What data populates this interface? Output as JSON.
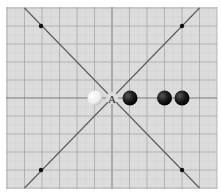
{
  "board": {
    "background": "#dcdcdc",
    "grid_color": "#a8a8a8",
    "axis_color": "#7a7a7a",
    "diagonal_color": "#5a5a5a",
    "x_lines": [
      7,
      24.5,
      42,
      59.5,
      77,
      94.5,
      112,
      129.5,
      147,
      164.5,
      182,
      199.5,
      217
    ],
    "y_lines": [
      8,
      26,
      44,
      62,
      80,
      98,
      116,
      134,
      152,
      170,
      188
    ],
    "bounds": {
      "x": 6,
      "y": 7,
      "w": 211,
      "h": 182
    },
    "center": {
      "x": 112,
      "y": 98
    },
    "diagonals": [
      {
        "x1": 24.5,
        "y1": 8,
        "x2": 199.5,
        "y2": 188
      },
      {
        "x1": 199.5,
        "y1": 8,
        "x2": 24.5,
        "y2": 188
      }
    ],
    "marker_dots": [
      {
        "x": 41,
        "y": 26
      },
      {
        "x": 182,
        "y": 26
      },
      {
        "x": 41,
        "y": 170
      },
      {
        "x": 182,
        "y": 170
      }
    ]
  },
  "point_label": {
    "text": "A",
    "x": 112,
    "y": 98
  },
  "stones": [
    {
      "color": "white",
      "x": 95,
      "y": 98
    },
    {
      "color": "black",
      "x": 130,
      "y": 98
    },
    {
      "color": "black",
      "x": 164.5,
      "y": 98
    },
    {
      "color": "black",
      "x": 182,
      "y": 98
    }
  ]
}
